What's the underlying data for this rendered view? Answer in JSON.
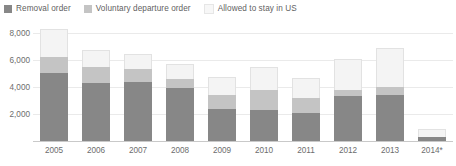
{
  "chart_data": {
    "type": "bar",
    "subtype": "stacked-bar",
    "title": "",
    "xlabel": "",
    "ylabel": "",
    "categories": [
      "2005",
      "2006",
      "2007",
      "2008",
      "2009",
      "2010",
      "2011",
      "2012",
      "2013",
      "2014*"
    ],
    "series": [
      {
        "name": "Removal order",
        "color": "#878787",
        "values": [
          5050,
          4300,
          4350,
          3900,
          2350,
          2300,
          2100,
          3300,
          3400,
          300
        ]
      },
      {
        "name": "Voluntary departure order",
        "color": "#c4c4c4",
        "values": [
          1150,
          1200,
          950,
          700,
          1050,
          1500,
          1100,
          500,
          600,
          0
        ]
      },
      {
        "name": "Allowed to stay in US",
        "color": "#f4f4f4",
        "values": [
          2100,
          1200,
          1150,
          1100,
          1350,
          1700,
          1450,
          2300,
          2900,
          600
        ]
      }
    ],
    "totals": [
      8300,
      6700,
      6450,
      5700,
      4750,
      5500,
      4650,
      6100,
      6900,
      900
    ],
    "ylim": [
      0,
      8800
    ],
    "yticks": [
      0,
      2000,
      4000,
      6000,
      8000
    ],
    "ytick_labels": [
      "0",
      "2,000",
      "4,000",
      "6,000",
      "8,000"
    ],
    "grid": true,
    "grid_axis": "y",
    "legend_position": "top-left",
    "footnote_marker": "*",
    "background_color": "#ffffff",
    "gridline_color": "#eaeaea",
    "axis_color": "#c9c9c9",
    "text_color": "#6d6d6d"
  },
  "legend": {
    "items": [
      {
        "label": "Removal order",
        "color": "#878787"
      },
      {
        "label": "Voluntary departure order",
        "color": "#c4c4c4"
      },
      {
        "label": "Allowed to stay in US",
        "color": "#f7f7f7"
      }
    ]
  }
}
